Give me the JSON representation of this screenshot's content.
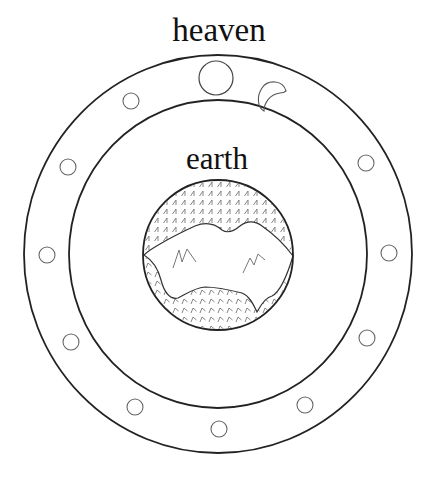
{
  "labels": {
    "heaven": "heaven",
    "earth": "earth"
  },
  "colors": {
    "background": "#ffffff",
    "ring_stroke": "#222222",
    "star_stroke": "#666666",
    "hatch_stroke": "#777777"
  },
  "geometry": {
    "center": [
      218,
      254
    ],
    "outer_ring": {
      "rx": 194,
      "ry": 199
    },
    "inner_ring": {
      "rx": 149,
      "ry": 154
    },
    "earth_disc": {
      "cx": 218,
      "cy": 255,
      "r": 75
    },
    "sun": {
      "cx": 216,
      "cy": 78,
      "r": 17
    },
    "moon": {
      "cx": 273,
      "cy": 98
    },
    "stars": [
      {
        "cx": 131,
        "cy": 101,
        "r": 8
      },
      {
        "cx": 68,
        "cy": 167,
        "r": 8
      },
      {
        "cx": 47,
        "cy": 255,
        "r": 8
      },
      {
        "cx": 71,
        "cy": 342,
        "r": 8
      },
      {
        "cx": 135,
        "cy": 407,
        "r": 8
      },
      {
        "cx": 219,
        "cy": 429,
        "r": 8
      },
      {
        "cx": 305,
        "cy": 405,
        "r": 8
      },
      {
        "cx": 367,
        "cy": 338,
        "r": 8
      },
      {
        "cx": 389,
        "cy": 253,
        "r": 8
      },
      {
        "cx": 366,
        "cy": 163,
        "r": 8
      }
    ]
  },
  "elements": {
    "outer_ring": "heaven boundary",
    "inner_ring": "earth sphere boundary",
    "celestial_bodies": [
      "sun",
      "moon",
      "stars"
    ],
    "earth_features": [
      "land mass",
      "mountains",
      "water/vegetation hatching"
    ]
  }
}
